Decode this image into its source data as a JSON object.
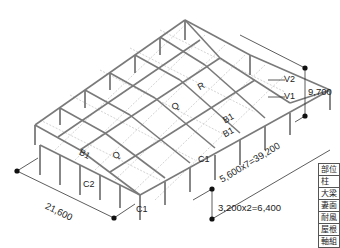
{
  "figure": {
    "type": "isometric steel frame structural diagram",
    "colors": {
      "frame": "#7a7a7a",
      "bracing": "#a8a8a8",
      "dimension_line": "#333333",
      "dimension_dot": "#111111",
      "background": "#ffffff"
    }
  },
  "dimensions": {
    "width": "21,600",
    "length": "5,600x7=39,200",
    "height": "9,700",
    "bay": "3,200x2=6,400"
  },
  "member_labels": {
    "v2": "V2",
    "v1": "V1",
    "r": "R",
    "q_center": "Q",
    "q_front": "Q",
    "q_left": "Q",
    "b1_right_upper": "B1",
    "b1_right_lower": "B1",
    "b1_left": "B1",
    "c1_center": "C1",
    "c1_front": "C1",
    "c2": "C2"
  },
  "legend_table": {
    "rows": [
      "部位",
      "柱",
      "大梁",
      "妻面",
      "耐風",
      "屋根",
      "軸組"
    ]
  }
}
